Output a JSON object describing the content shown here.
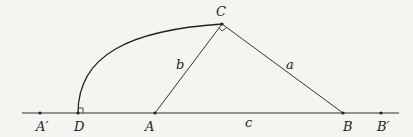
{
  "diagram": {
    "type": "geometry-construction",
    "points": {
      "A_prime": {
        "label": "A′",
        "x": 40,
        "y": 113
      },
      "D": {
        "label": "D",
        "x": 78,
        "y": 113
      },
      "A": {
        "label": "A",
        "x": 155,
        "y": 113
      },
      "C": {
        "label": "C",
        "x": 222,
        "y": 24
      },
      "B": {
        "label": "B",
        "x": 343,
        "y": 113
      },
      "B_prime": {
        "label": "B′",
        "x": 381,
        "y": 113
      }
    },
    "sides": {
      "a": {
        "label": "a"
      },
      "b": {
        "label": "b"
      },
      "c": {
        "label": "c"
      }
    },
    "colors": {
      "line": "#333333",
      "background": "#f4f4f1"
    }
  }
}
